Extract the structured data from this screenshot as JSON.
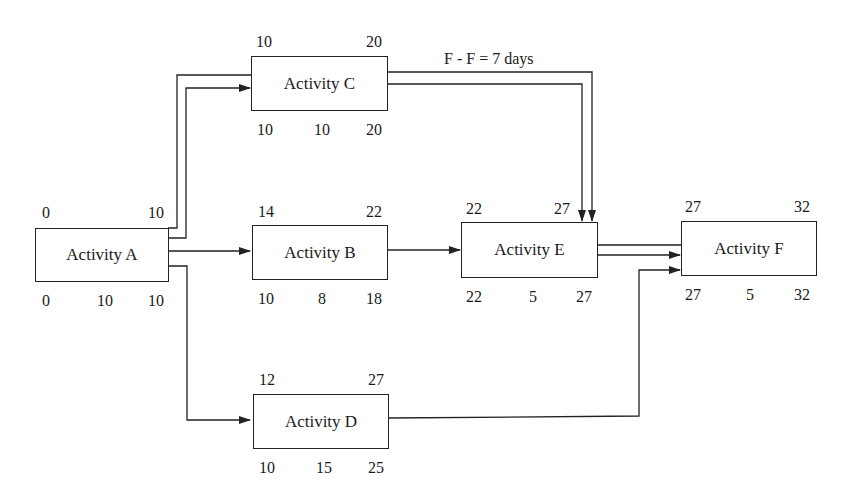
{
  "diagram": {
    "type": "precedence network (activity-on-node)",
    "activities": [
      {
        "id": "A",
        "label": "Activity A",
        "top_left": "0",
        "top_right": "10",
        "bottom_left": "0",
        "bottom_mid": "10",
        "bottom_right": "10"
      },
      {
        "id": "B",
        "label": "Activity B",
        "top_left": "14",
        "top_right": "22",
        "bottom_left": "10",
        "bottom_mid": "8",
        "bottom_right": "18"
      },
      {
        "id": "C",
        "label": "Activity C",
        "top_left": "10",
        "top_right": "20",
        "bottom_left": "10",
        "bottom_mid": "10",
        "bottom_right": "20"
      },
      {
        "id": "D",
        "label": "Activity D",
        "top_left": "12",
        "top_right": "27",
        "bottom_left": "10",
        "bottom_mid": "15",
        "bottom_right": "25"
      },
      {
        "id": "E",
        "label": "Activity E",
        "top_left": "22",
        "top_right": "27",
        "bottom_left": "22",
        "bottom_mid": "5",
        "bottom_right": "27"
      },
      {
        "id": "F",
        "label": "Activity F",
        "top_left": "27",
        "top_right": "32",
        "bottom_left": "27",
        "bottom_mid": "5",
        "bottom_right": "32"
      }
    ],
    "links": [
      {
        "from": "A",
        "to": "C",
        "style": "double-line"
      },
      {
        "from": "A",
        "to": "B",
        "style": "single"
      },
      {
        "from": "A",
        "to": "D",
        "style": "single"
      },
      {
        "from": "B",
        "to": "E",
        "style": "single"
      },
      {
        "from": "C",
        "to": "E",
        "style": "double-line",
        "annotation": "F - F = 7 days"
      },
      {
        "from": "E",
        "to": "F",
        "style": "double-line"
      },
      {
        "from": "D",
        "to": "F",
        "style": "single"
      }
    ],
    "annotation": "F - F = 7 days"
  }
}
